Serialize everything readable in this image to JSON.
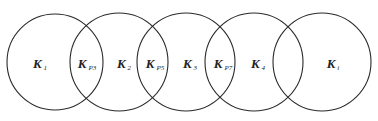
{
  "diagram": {
    "type": "overlapping-circles-chain",
    "stroke_color": "#2a2a2a",
    "circles": [
      {
        "id": "K1",
        "cx": 55,
        "cy": 62,
        "r": 48
      },
      {
        "id": "K2",
        "cx": 119,
        "cy": 62,
        "r": 49
      },
      {
        "id": "K3",
        "cx": 186,
        "cy": 62,
        "r": 49
      },
      {
        "id": "K4",
        "cx": 254,
        "cy": 62,
        "r": 49
      },
      {
        "id": "Ki",
        "cx": 322,
        "cy": 62,
        "r": 49
      }
    ],
    "labels": [
      {
        "main": "K",
        "sub": "1",
        "x": 40,
        "y": 64
      },
      {
        "main": "K",
        "sub": "P3",
        "x": 87,
        "y": 64
      },
      {
        "main": "K",
        "sub": "2",
        "x": 124,
        "y": 64
      },
      {
        "main": "K",
        "sub": "P5",
        "x": 155,
        "y": 64
      },
      {
        "main": "K",
        "sub": "3",
        "x": 190,
        "y": 64
      },
      {
        "main": "K",
        "sub": "P7",
        "x": 223,
        "y": 64
      },
      {
        "main": "K",
        "sub": "4",
        "x": 258,
        "y": 64
      },
      {
        "main": "K",
        "sub": "i",
        "x": 333,
        "y": 64
      }
    ]
  }
}
